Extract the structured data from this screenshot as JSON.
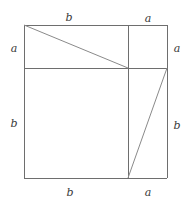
{
  "figure": {
    "stroke_color": "#6e6e6e",
    "diagonal_color": "#8a8a8a",
    "background_color": "#ffffff",
    "label_color": "#3a3a3a",
    "square": {
      "left": 24,
      "top": 25,
      "right": 167,
      "bottom": 178,
      "width": 143,
      "height": 153
    },
    "divisions": {
      "horizontal_line_y": 68,
      "vertical_line_x": 128
    },
    "segments": {
      "a_horizontal_length": 39,
      "b_horizontal_length": 104,
      "a_vertical_length": 43,
      "b_vertical_length": 110
    },
    "lines": [
      {
        "name": "square-top-edge",
        "x1": 24,
        "y1": 25,
        "x2": 167,
        "y2": 25
      },
      {
        "name": "square-right-edge",
        "x1": 167,
        "y1": 25,
        "x2": 167,
        "y2": 178
      },
      {
        "name": "square-bottom-edge",
        "x1": 167,
        "y1": 178,
        "x2": 24,
        "y2": 178
      },
      {
        "name": "square-left-edge",
        "x1": 24,
        "y1": 178,
        "x2": 24,
        "y2": 25
      },
      {
        "name": "horizontal-divider",
        "x1": 24,
        "y1": 68,
        "x2": 167,
        "y2": 68
      },
      {
        "name": "vertical-divider",
        "x1": 128,
        "y1": 25,
        "x2": 128,
        "y2": 178
      },
      {
        "name": "upper-left-diagonal",
        "x1": 24,
        "y1": 25,
        "x2": 128,
        "y2": 68
      },
      {
        "name": "lower-right-diagonal",
        "x1": 128,
        "y1": 178,
        "x2": 167,
        "y2": 68
      }
    ],
    "labels": [
      {
        "name": "label-top-b",
        "text": "b",
        "x": 69,
        "y": 17,
        "side": "top",
        "segment": "b"
      },
      {
        "name": "label-top-a",
        "text": "a",
        "x": 148,
        "y": 18,
        "side": "top",
        "segment": "a"
      },
      {
        "name": "label-left-a",
        "text": "a",
        "x": 14,
        "y": 48,
        "side": "left",
        "segment": "a"
      },
      {
        "name": "label-left-b",
        "text": "b",
        "x": 14,
        "y": 123,
        "side": "left",
        "segment": "b"
      },
      {
        "name": "label-right-a",
        "text": "a",
        "x": 177,
        "y": 48,
        "side": "right",
        "segment": "a"
      },
      {
        "name": "label-right-b",
        "text": "b",
        "x": 177,
        "y": 125,
        "side": "right",
        "segment": "b"
      },
      {
        "name": "label-bottom-b",
        "text": "b",
        "x": 70,
        "y": 192,
        "side": "bottom",
        "segment": "b"
      },
      {
        "name": "label-bottom-a",
        "text": "a",
        "x": 148,
        "y": 192,
        "side": "bottom",
        "segment": "a"
      }
    ]
  }
}
